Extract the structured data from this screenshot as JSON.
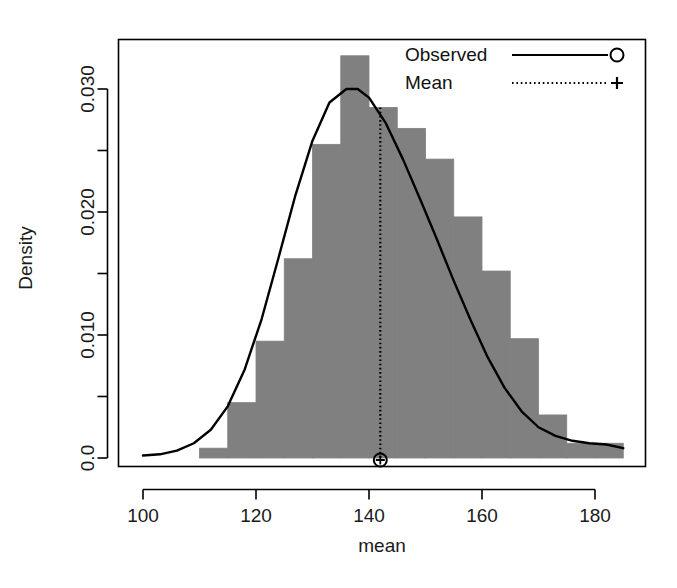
{
  "chart_data": {
    "type": "bar",
    "title": "",
    "subtitle": "",
    "xlabel": "mean",
    "ylabel": "Density",
    "xlim": [
      97,
      190
    ],
    "ylim": [
      0.0,
      0.0347
    ],
    "grid": false,
    "xticks": [
      100,
      120,
      140,
      160,
      180
    ],
    "xtick_labels": [
      "100",
      "120",
      "140",
      "160",
      "180"
    ],
    "yticks": [
      0.0,
      0.005,
      0.01,
      0.015,
      0.02,
      0.025,
      0.03
    ],
    "ytick_labels": [
      "0.0",
      "",
      "0.010",
      "",
      "0.020",
      "",
      "0.030"
    ],
    "bin_width": 5,
    "histogram": {
      "name": "Density histogram",
      "fill_color": "#808080",
      "edge_color": "#808080",
      "bin_edges": [
        110,
        115,
        120,
        125,
        130,
        135,
        140,
        145,
        150,
        155,
        160,
        165,
        170,
        175,
        180,
        185
      ],
      "bin_left": [
        110,
        115,
        120,
        125,
        130,
        135,
        140,
        145,
        150,
        155,
        160,
        165,
        170,
        175,
        180
      ],
      "densities": [
        0.0008,
        0.0045,
        0.0095,
        0.0162,
        0.0255,
        0.0327,
        0.0285,
        0.0268,
        0.0243,
        0.0196,
        0.0152,
        0.0097,
        0.0035,
        0.0012,
        0.0012
      ]
    },
    "series": [
      {
        "name": "Observed",
        "type": "line",
        "line_style": "solid",
        "marker": "circle",
        "color": "#000000",
        "x": [
          100,
          103,
          106,
          109,
          112,
          115,
          118,
          121,
          124,
          127,
          130,
          133,
          136,
          138,
          140,
          143,
          146,
          149,
          152,
          155,
          158,
          161,
          164,
          167,
          170,
          173,
          176,
          179,
          182,
          185
        ],
        "y": [
          0.0002,
          0.0003,
          0.0006,
          0.0012,
          0.0023,
          0.0042,
          0.0072,
          0.0113,
          0.0163,
          0.0214,
          0.0258,
          0.0289,
          0.03,
          0.03,
          0.0293,
          0.0272,
          0.0243,
          0.0211,
          0.0178,
          0.0144,
          0.0112,
          0.0082,
          0.0057,
          0.0038,
          0.0025,
          0.0018,
          0.0014,
          0.0012,
          0.0011,
          0.0008
        ]
      },
      {
        "name": "Mean",
        "type": "vline",
        "line_style": "dotted",
        "marker": "plus",
        "color": "#000000",
        "x": 142,
        "y_top": 0.0285,
        "y_bottom": 0.0
      }
    ],
    "legend": {
      "position": "top-right",
      "entries": [
        {
          "label": "Observed",
          "line_style": "solid",
          "marker": "circle"
        },
        {
          "label": "Mean",
          "line_style": "dotted",
          "marker": "plus"
        }
      ]
    }
  }
}
